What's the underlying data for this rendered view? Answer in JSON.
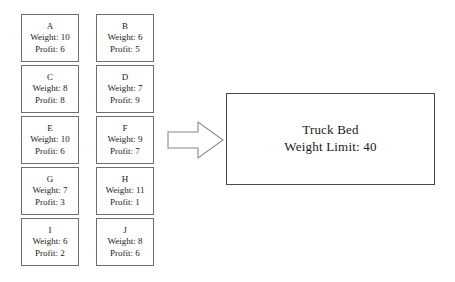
{
  "diagram": {
    "background_color": "#ffffff",
    "box_border_color": "#6e6e6e",
    "text_color": "#1a1a1a"
  },
  "items": {
    "weight_prefix": "Weight: ",
    "profit_prefix": "Profit: ",
    "list": [
      {
        "label": "A",
        "weight": 10,
        "profit": 6,
        "weight_text": "Weight: 10",
        "profit_text": "Profit: 6"
      },
      {
        "label": "B",
        "weight": 6,
        "profit": 5,
        "weight_text": "Weight: 6",
        "profit_text": "Profit: 5"
      },
      {
        "label": "C",
        "weight": 8,
        "profit": 8,
        "weight_text": "Weight: 8",
        "profit_text": "Profit: 8"
      },
      {
        "label": "D",
        "weight": 7,
        "profit": 9,
        "weight_text": "Weight: 7",
        "profit_text": "Profit: 9"
      },
      {
        "label": "E",
        "weight": 10,
        "profit": 6,
        "weight_text": "Weight: 10",
        "profit_text": "Profit: 6"
      },
      {
        "label": "F",
        "weight": 9,
        "profit": 7,
        "weight_text": "Weight: 9",
        "profit_text": "Profit: 7"
      },
      {
        "label": "G",
        "weight": 7,
        "profit": 3,
        "weight_text": "Weight: 7",
        "profit_text": "Profit: 3"
      },
      {
        "label": "H",
        "weight": 11,
        "profit": 1,
        "weight_text": "Weight: 11",
        "profit_text": "Profit: 1"
      },
      {
        "label": "I",
        "weight": 6,
        "profit": 2,
        "weight_text": "Weight: 6",
        "profit_text": "Profit: 2"
      },
      {
        "label": "J",
        "weight": 8,
        "profit": 6,
        "weight_text": "Weight: 8",
        "profit_text": "Profit: 6"
      }
    ]
  },
  "arrow": {
    "icon": "right-block-arrow-icon",
    "direction": "right",
    "fill": "#ffffff",
    "stroke": "#8a8a8a"
  },
  "truck_bed": {
    "title": "Truck Bed",
    "limit_text": "Weight Limit: 40",
    "weight_limit": 40
  }
}
